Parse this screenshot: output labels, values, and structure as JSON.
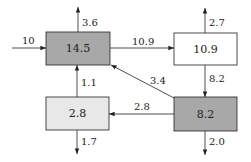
{
  "diagram": {
    "colors": {
      "dark_box": "#a8a8a8",
      "light_box": "#e8e8e8",
      "white_box": "#ffffff",
      "stroke": "#222222"
    },
    "nodes": [
      {
        "id": "A",
        "value": "14.5",
        "x": 46,
        "y": 32,
        "w": 64,
        "h": 33,
        "fill": "dark"
      },
      {
        "id": "B",
        "value": "10.9",
        "x": 174,
        "y": 33,
        "w": 63,
        "h": 32,
        "fill": "white"
      },
      {
        "id": "C",
        "value": "2.8",
        "x": 46,
        "y": 97,
        "w": 63,
        "h": 33,
        "fill": "light"
      },
      {
        "id": "D",
        "value": "8.2",
        "x": 174,
        "y": 97,
        "w": 63,
        "h": 34,
        "fill": "dark"
      }
    ],
    "flows": {
      "input_A": "10",
      "A_out_top": "3.6",
      "A_to_B": "10.9",
      "B_out_top": "2.7",
      "B_to_D": "8.2",
      "D_to_A": "3.4",
      "D_to_C": "2.8",
      "C_to_A": "1.1",
      "C_out_bottom": "1.7",
      "D_out_bottom": "2.0"
    }
  }
}
